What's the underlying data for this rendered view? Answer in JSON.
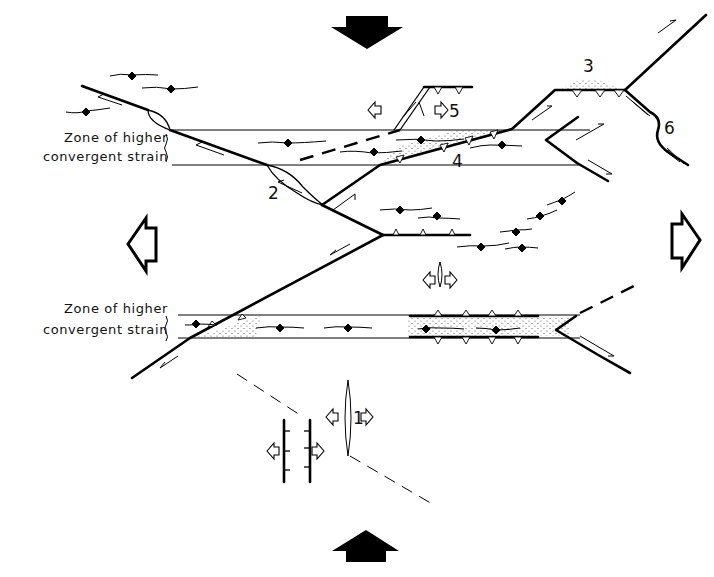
{
  "figure": {
    "type": "structural-geology-diagram"
  },
  "labels": {
    "zone_upper_line1": "Zone of higher",
    "zone_upper_line2": "convergent strain",
    "zone_lower_line1": "Zone of higher",
    "zone_lower_line2": "convergent strain",
    "n1": "1",
    "n2": "2",
    "n3": "3",
    "n4": "4",
    "n5": "5",
    "n6": "6"
  },
  "arrows": {
    "compression_top": "solid-arrow-down",
    "compression_bottom": "solid-arrow-up",
    "extension_left": "open-arrow-left",
    "extension_right": "open-arrow-right"
  },
  "colors": {
    "ink": "#000000",
    "background": "#ffffff",
    "stipple": "#555555"
  }
}
